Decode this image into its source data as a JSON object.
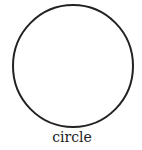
{
  "diagram": {
    "shape": "circle",
    "label": "circle",
    "stroke_color": "#222222",
    "fill_color": "#ffffff"
  }
}
